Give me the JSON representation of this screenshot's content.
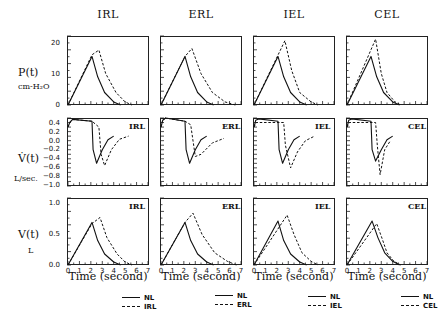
{
  "columns": [
    "IRL",
    "ERL",
    "IEL",
    "CEL"
  ],
  "rows": {
    "pressure": {
      "label": "P(t)",
      "unit": "cm-H₂O",
      "yticks": [
        "20",
        "10",
        "0"
      ]
    },
    "flow": {
      "label": "V̇(t)",
      "unit": "L/sec.",
      "yticks": [
        "0.4",
        "0.2",
        "0.0",
        "−0.2",
        "−0.4",
        "−0.6",
        "−0.8",
        "−1.0"
      ]
    },
    "volume": {
      "label": "V(t)",
      "unit": "L",
      "yticks": [
        "1.0",
        "0.5",
        "0.0"
      ]
    }
  },
  "xticks": [
    "0",
    "1",
    "2",
    "3",
    "4",
    "5",
    "6",
    "7"
  ],
  "xlabel": "Time  (second)",
  "legends": [
    {
      "solid": "NL",
      "dashed": "IRL"
    },
    {
      "solid": "NL",
      "dashed": "ERL"
    },
    {
      "solid": "NL",
      "dashed": "IEL"
    },
    {
      "solid": "NL",
      "dashed": "CEL"
    }
  ],
  "chart_data": {
    "type": "line",
    "xlabel": "Time (second)",
    "xlim": [
      0,
      7
    ],
    "grid": false,
    "legend_position": "below each column",
    "panels": [
      {
        "row": "P(t) cm-H2O",
        "ylim": [
          0,
          22
        ],
        "columns": [
          {
            "name": "IRL",
            "series": [
              {
                "name": "NL",
                "x": [
                  0,
                  2.1,
                  2.6,
                  3.2,
                  4.0,
                  4.6
                ],
                "y": [
                  0,
                  15.5,
                  9,
                  4,
                  1,
                  0
                ]
              },
              {
                "name": "IRL",
                "x": [
                  0,
                  2.1,
                  2.7,
                  3.3,
                  4.2,
                  5.0,
                  5.6
                ],
                "y": [
                  0,
                  16,
                  17.5,
                  10,
                  4,
                  1,
                  0
                ]
              }
            ]
          },
          {
            "name": "ERL",
            "series": [
              {
                "name": "NL",
                "x": [
                  0,
                  2.1,
                  2.6,
                  3.2,
                  4.0,
                  4.6
                ],
                "y": [
                  0,
                  15.5,
                  9,
                  4,
                  1,
                  0
                ]
              },
              {
                "name": "ERL",
                "x": [
                  0,
                  2.1,
                  2.7,
                  3.5,
                  4.5,
                  5.6,
                  6.5
                ],
                "y": [
                  0,
                  15.5,
                  18,
                  10,
                  4,
                  1,
                  0
                ]
              }
            ]
          },
          {
            "name": "IEL",
            "series": [
              {
                "name": "NL",
                "x": [
                  0,
                  2.1,
                  2.6,
                  3.2,
                  4.0,
                  4.6
                ],
                "y": [
                  0,
                  15.5,
                  9,
                  4,
                  1,
                  0
                ]
              },
              {
                "name": "IEL",
                "x": [
                  0,
                  2.7,
                  3.3,
                  4.0,
                  5.0,
                  5.6
                ],
                "y": [
                  0,
                  20.5,
                  11,
                  4,
                  1,
                  0
                ]
              }
            ]
          },
          {
            "name": "CEL",
            "series": [
              {
                "name": "NL",
                "x": [
                  0,
                  2.1,
                  2.6,
                  3.2,
                  4.0,
                  4.6
                ],
                "y": [
                  0,
                  15.5,
                  9,
                  4,
                  1,
                  0
                ]
              },
              {
                "name": "CEL",
                "x": [
                  0,
                  2.5,
                  3.0,
                  3.5,
                  4.2,
                  4.7
                ],
                "y": [
                  0,
                  21,
                  10,
                  4,
                  1,
                  0
                ]
              }
            ]
          }
        ]
      },
      {
        "row": "V'(t) L/sec.",
        "ylim": [
          -1.0,
          0.5
        ],
        "columns": [
          {
            "name": "IRL",
            "series": [
              {
                "name": "NL",
                "x": [
                  0,
                  0.15,
                  0.4,
                  2.1,
                  2.2,
                  2.5,
                  3.0,
                  3.5,
                  4.0
                ],
                "y": [
                  0.3,
                  0.4,
                  0.47,
                  0.43,
                  -0.2,
                  -0.5,
                  -0.2,
                  0.02,
                  0.1
                ]
              },
              {
                "name": "IRL",
                "x": [
                  0,
                  0.15,
                  0.4,
                  2.1,
                  2.7,
                  2.9,
                  3.2,
                  3.8,
                  4.5,
                  5.3
                ],
                "y": [
                  0.3,
                  0.4,
                  0.47,
                  0.43,
                  0.3,
                  -0.3,
                  -0.55,
                  -0.2,
                  0.03,
                  0.1
                ]
              }
            ]
          },
          {
            "name": "ERL",
            "series": [
              {
                "name": "NL",
                "x": [
                  0,
                  0.15,
                  0.4,
                  2.1,
                  2.2,
                  2.5,
                  3.0,
                  3.5,
                  4.0
                ],
                "y": [
                  0.3,
                  0.45,
                  0.5,
                  0.43,
                  -0.2,
                  -0.5,
                  -0.2,
                  0.02,
                  0.1
                ]
              },
              {
                "name": "ERL",
                "x": [
                  0,
                  0.15,
                  0.4,
                  2.1,
                  2.6,
                  3.0,
                  3.5,
                  4.5,
                  5.5
                ],
                "y": [
                  0.3,
                  0.45,
                  0.5,
                  0.43,
                  0.35,
                  -0.35,
                  -0.3,
                  -0.05,
                  0.05
                ]
              }
            ]
          },
          {
            "name": "IEL",
            "series": [
              {
                "name": "NL",
                "x": [
                  0,
                  0.15,
                  0.4,
                  2.1,
                  2.2,
                  2.5,
                  3.0,
                  3.5,
                  4.0
                ],
                "y": [
                  0.3,
                  0.45,
                  0.48,
                  0.43,
                  -0.2,
                  -0.5,
                  -0.2,
                  0.02,
                  0.1
                ]
              },
              {
                "name": "IEL",
                "x": [
                  0,
                  0.2,
                  2.6,
                  2.75,
                  3.2,
                  3.8,
                  4.5,
                  5.3
                ],
                "y": [
                  0.3,
                  0.4,
                  0.4,
                  -0.1,
                  -0.6,
                  -0.25,
                  0.0,
                  0.1
                ]
              }
            ]
          },
          {
            "name": "CEL",
            "series": [
              {
                "name": "NL",
                "x": [
                  0,
                  0.15,
                  0.4,
                  2.1,
                  2.2,
                  2.5,
                  3.0,
                  3.5,
                  4.0
                ],
                "y": [
                  0.3,
                  0.45,
                  0.48,
                  0.43,
                  -0.2,
                  -0.45,
                  -0.2,
                  0.02,
                  0.1
                ]
              },
              {
                "name": "CEL",
                "x": [
                  0,
                  0.2,
                  2.5,
                  2.65,
                  2.9,
                  3.3,
                  3.8
                ],
                "y": [
                  0.3,
                  0.4,
                  0.4,
                  -0.1,
                  -0.75,
                  -0.2,
                  0.0
                ]
              }
            ]
          }
        ]
      },
      {
        "row": "V(t) L",
        "ylim": [
          0,
          1.1
        ],
        "columns": [
          {
            "name": "IRL",
            "series": [
              {
                "name": "NL",
                "x": [
                  0,
                  2.1,
                  2.6,
                  3.2,
                  4.0,
                  4.6
                ],
                "y": [
                  0,
                  0.7,
                  0.4,
                  0.18,
                  0.05,
                  0
                ]
              },
              {
                "name": "IRL",
                "x": [
                  0,
                  2.1,
                  2.8,
                  3.4,
                  4.3,
                  5.0,
                  5.6
                ],
                "y": [
                  0,
                  0.68,
                  0.78,
                  0.45,
                  0.18,
                  0.05,
                  0
                ]
              }
            ]
          },
          {
            "name": "ERL",
            "series": [
              {
                "name": "NL",
                "x": [
                  0,
                  2.1,
                  2.6,
                  3.2,
                  4.0,
                  4.6
                ],
                "y": [
                  0,
                  0.7,
                  0.4,
                  0.18,
                  0.05,
                  0
                ]
              },
              {
                "name": "ERL",
                "x": [
                  0,
                  2.1,
                  2.8,
                  3.6,
                  4.7,
                  5.8,
                  6.6
                ],
                "y": [
                  0,
                  0.7,
                  0.85,
                  0.5,
                  0.2,
                  0.06,
                  0
                ]
              }
            ]
          },
          {
            "name": "IEL",
            "series": [
              {
                "name": "NL",
                "x": [
                  0,
                  2.1,
                  2.6,
                  3.2,
                  4.0,
                  4.6
                ],
                "y": [
                  0,
                  0.72,
                  0.4,
                  0.18,
                  0.05,
                  0
                ]
              },
              {
                "name": "IEL",
                "x": [
                  0,
                  2.9,
                  3.5,
                  4.2,
                  5.0,
                  5.6
                ],
                "y": [
                  0,
                  0.82,
                  0.5,
                  0.2,
                  0.06,
                  0
                ]
              }
            ]
          },
          {
            "name": "CEL",
            "series": [
              {
                "name": "NL",
                "x": [
                  0,
                  2.2,
                  2.7,
                  3.3,
                  4.0,
                  4.6
                ],
                "y": [
                  0,
                  0.72,
                  0.45,
                  0.2,
                  0.06,
                  0
                ]
              },
              {
                "name": "CEL",
                "x": [
                  0,
                  2.6,
                  3.1,
                  3.5,
                  4.1,
                  4.7
                ],
                "y": [
                  0,
                  0.68,
                  0.42,
                  0.2,
                  0.06,
                  0
                ]
              }
            ]
          }
        ]
      }
    ]
  }
}
